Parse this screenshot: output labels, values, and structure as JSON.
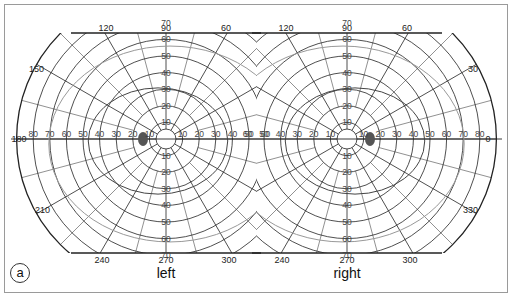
{
  "figure": {
    "panel_label": "a",
    "fields": [
      {
        "eye": "left",
        "center": [
          166,
          139
        ],
        "angle_labels": {
          "top": [
            "120",
            "90",
            "60"
          ],
          "left_upper": "150",
          "left": "180",
          "left_lower": "210",
          "bottom": [
            "240",
            "270",
            "300"
          ]
        },
        "radial_labels_horizontal_left": [
          "80",
          "70",
          "60",
          "50",
          "40",
          "30",
          "20",
          "10"
        ],
        "radial_labels_horizontal_right": [
          "10",
          "20",
          "30",
          "40",
          "50",
          "60"
        ],
        "radial_labels_vertical_up": [
          "10",
          "20",
          "30",
          "40",
          "50",
          "60",
          "70"
        ],
        "radial_labels_vertical_down": [
          "10",
          "20",
          "30",
          "40",
          "50",
          "60",
          "70"
        ],
        "blind_spot_side": "left"
      },
      {
        "eye": "right",
        "center": [
          347,
          139
        ],
        "angle_labels": {
          "top": [
            "120",
            "90",
            "60"
          ],
          "right_upper": "30",
          "right": "0",
          "right_lower": "330",
          "bottom": [
            "240",
            "270",
            "300"
          ]
        },
        "radial_labels_horizontal_left": [
          "60",
          "50",
          "40",
          "30",
          "20",
          "10"
        ],
        "radial_labels_horizontal_right": [
          "10",
          "20",
          "30",
          "40",
          "50",
          "60",
          "70",
          "80"
        ],
        "radial_labels_vertical_up": [
          "10",
          "20",
          "30",
          "40",
          "50",
          "60",
          "70"
        ],
        "radial_labels_vertical_down": [
          "10",
          "20",
          "30",
          "40",
          "50",
          "60",
          "70"
        ],
        "blind_spot_side": "right"
      }
    ],
    "colors": {
      "grid": "#222222",
      "isopter_dark": "#444444",
      "isopter_light": "#999999",
      "blind_spot": "#555555",
      "border": "#9a9a9a"
    }
  }
}
